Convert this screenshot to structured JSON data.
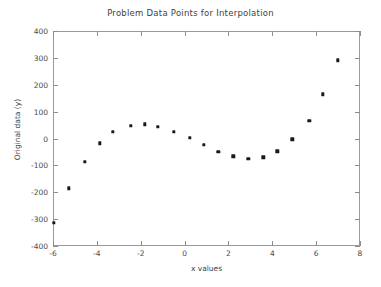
{
  "chart_data": {
    "type": "scatter",
    "title": "Problem Data Points for Interpolation",
    "xlabel": "x values",
    "ylabel": "Original data (y)",
    "xlim": [
      -6,
      8
    ],
    "ylim": [
      -400,
      400
    ],
    "xticks": [
      -6,
      -4,
      -2,
      0,
      2,
      4,
      6,
      8
    ],
    "yticks": [
      -400,
      -300,
      -200,
      -100,
      0,
      100,
      200,
      300,
      400
    ],
    "grid": false,
    "legend": null,
    "marker": "filled-square",
    "marker_color": "#1a1a1a",
    "series": [
      {
        "name": "Original data",
        "x": [
          -6.0,
          -5.32,
          -4.59,
          -3.91,
          -3.32,
          -2.5,
          -1.86,
          -1.27,
          -0.55,
          0.18,
          0.82,
          1.5,
          2.18,
          2.86,
          3.55,
          4.18,
          4.86,
          5.64,
          6.27,
          6.95
        ],
        "y": [
          -310,
          -181,
          -84,
          -14,
          28,
          51,
          57,
          47,
          28,
          6,
          -19,
          -45,
          -63,
          -71,
          -66,
          -44,
          1,
          69,
          168,
          295
        ]
      }
    ]
  },
  "figure": {
    "background_color": "#ffffff",
    "frame_color": "#9a9a9a",
    "text_color": "#3f3f3f"
  }
}
